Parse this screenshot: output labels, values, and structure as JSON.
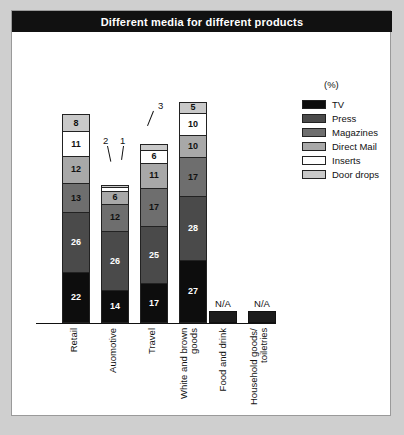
{
  "title": "Different media for different products",
  "unit_label": "(%)",
  "legend": {
    "items": [
      {
        "label": "TV",
        "color": "#0d0d0d"
      },
      {
        "label": "Press",
        "color": "#4a4a4a"
      },
      {
        "label": "Magazines",
        "color": "#6e6e6e"
      },
      {
        "label": "Direct Mail",
        "color": "#a8a8a8"
      },
      {
        "label": "Inserts",
        "color": "#ffffff"
      },
      {
        "label": "Door drops",
        "color": "#c9c9c9"
      }
    ]
  },
  "na_text": "N/A",
  "chart_data": {
    "type": "bar",
    "stacked": true,
    "title": "Different media for different products",
    "xlabel": "",
    "ylabel": "",
    "unit": "%",
    "grid": false,
    "legend_position": "right",
    "categories": [
      "Retail",
      "Auomotive",
      "Travel",
      "White and brown goods",
      "Food and drink",
      "Household goods/ toiletries"
    ],
    "series": [
      {
        "name": "TV",
        "color": "#0d0d0d",
        "values": [
          22,
          14,
          17,
          27,
          null,
          null
        ]
      },
      {
        "name": "Press",
        "color": "#4a4a4a",
        "values": [
          26,
          26,
          25,
          28,
          null,
          null
        ]
      },
      {
        "name": "Magazines",
        "color": "#6e6e6e",
        "values": [
          13,
          12,
          17,
          17,
          null,
          null
        ]
      },
      {
        "name": "Direct Mail",
        "color": "#a8a8a8",
        "values": [
          12,
          6,
          11,
          10,
          null,
          null
        ]
      },
      {
        "name": "Inserts",
        "color": "#ffffff",
        "values": [
          11,
          2,
          6,
          10,
          null,
          null
        ]
      },
      {
        "name": "Door drops",
        "color": "#c9c9c9",
        "values": [
          8,
          1,
          3,
          5,
          null,
          null
        ]
      }
    ],
    "totals": [
      92,
      61,
      79,
      97,
      null,
      null
    ],
    "na_categories": [
      "Food and drink",
      "Household goods/ toiletries"
    ],
    "annotations": [
      {
        "text": "2",
        "category": "Auomotive",
        "series": "Inserts"
      },
      {
        "text": "1",
        "category": "Auomotive",
        "series": "Door drops"
      },
      {
        "text": "3",
        "category": "Travel",
        "series": "Door drops"
      }
    ]
  }
}
